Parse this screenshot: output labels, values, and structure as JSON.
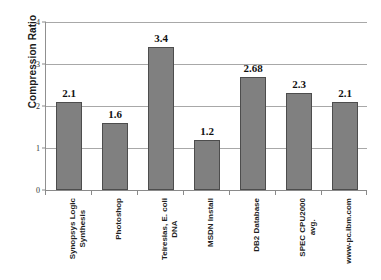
{
  "chart_data": {
    "type": "bar",
    "title": "",
    "xlabel": "",
    "ylabel": "Compression Ratio",
    "ylim": [
      0,
      4
    ],
    "yticks": [
      "0",
      "1",
      "2",
      "3",
      "4"
    ],
    "grid": true,
    "legend": "none",
    "orientation": "vertical",
    "bar_color": "#808080",
    "bar_edge_color": "#4d4d4d",
    "categories": [
      "Synopsys Logic Synthesis",
      "Photoshop",
      "Teiresias, E. coli DNA",
      "MSDN Install",
      "DB2 Database",
      "SPEC CPU2000 avg.",
      "www-pc.ibm.com"
    ],
    "category_lines": [
      [
        "Synopsys Logic",
        "Synthesis"
      ],
      [
        "Photoshop",
        ""
      ],
      [
        "Teiresias, E. coli",
        "DNA"
      ],
      [
        "MSDN Install",
        ""
      ],
      [
        "DB2 Database",
        ""
      ],
      [
        "SPEC CPU2000",
        "avg."
      ],
      [
        "www-pc.ibm.com",
        ""
      ]
    ],
    "values": [
      2.1,
      1.6,
      3.4,
      1.2,
      2.68,
      2.3,
      2.1
    ],
    "data_labels": [
      "2.1",
      "1.6",
      "3.4",
      "1.2",
      "2.68",
      "2.3",
      "2.1"
    ]
  }
}
